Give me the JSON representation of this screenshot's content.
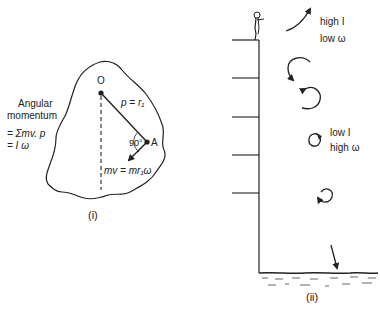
{
  "panel_i": {
    "caption": "(i)",
    "side_label": {
      "line1": "Angular",
      "line2": "momentum",
      "eq1": "= Σmv. p",
      "eq2": "= I ω"
    },
    "point_O": "O",
    "point_A": "A",
    "radius_label": "p = r₁",
    "angle_label": "90°",
    "velocity_label": "mv = mr₁ω"
  },
  "panel_ii": {
    "caption": "(ii)",
    "top_label": {
      "line1": "high I",
      "line2": "low ω"
    },
    "mid_label": {
      "line1": "low I",
      "line2": "high ω"
    }
  },
  "colors": {
    "ink": "#222222",
    "background": "#ffffff"
  }
}
